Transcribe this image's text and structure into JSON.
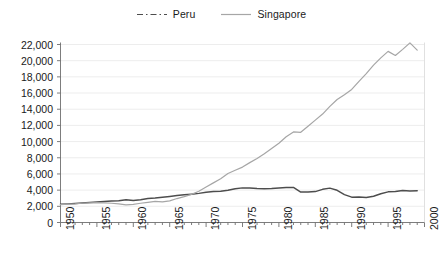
{
  "legend": {
    "position": "top-center",
    "entries": [
      {
        "label": "Peru",
        "color": "#4d4d4d",
        "style": "dash-dot",
        "icon": "legend-line-icon"
      },
      {
        "label": "Singapore",
        "color": "#a6a6a6",
        "style": "solid",
        "icon": "legend-line-icon"
      }
    ]
  },
  "chart_data": {
    "type": "line",
    "title": "",
    "subtitle": "",
    "xlabel": "",
    "ylabel": "",
    "xlim": [
      1950,
      2000
    ],
    "ylim": [
      0,
      22000
    ],
    "grid": true,
    "grid_axis": "y",
    "x_tick_step_major": 5,
    "x_tick_step_minor": 1,
    "y_tick_step": 2000,
    "xticks": [
      "1950",
      "1955",
      "1960",
      "1965",
      "1970",
      "1975",
      "1980",
      "1985",
      "1990",
      "1995",
      "2000"
    ],
    "yticks": [
      "0",
      "2,000",
      "4,000",
      "6,000",
      "8,000",
      "10,000",
      "12,000",
      "14,000",
      "16,000",
      "18,000",
      "20,000",
      "22,000"
    ],
    "x": [
      1950,
      1951,
      1952,
      1953,
      1954,
      1955,
      1956,
      1957,
      1958,
      1959,
      1960,
      1961,
      1962,
      1963,
      1964,
      1965,
      1966,
      1967,
      1968,
      1969,
      1970,
      1971,
      1972,
      1973,
      1974,
      1975,
      1976,
      1977,
      1978,
      1979,
      1980,
      1981,
      1982,
      1983,
      1984,
      1985,
      1986,
      1987,
      1988,
      1989,
      1990,
      1991,
      1992,
      1993,
      1994,
      1995,
      1996,
      1997,
      1998,
      1999
    ],
    "series": [
      {
        "name": "Peru",
        "color": "#4d4d4d",
        "style": "solid",
        "values": [
          2250,
          2300,
          2360,
          2420,
          2480,
          2540,
          2600,
          2660,
          2700,
          2800,
          2720,
          2820,
          2960,
          3020,
          3120,
          3220,
          3340,
          3420,
          3500,
          3600,
          3740,
          3820,
          3860,
          3980,
          4180,
          4280,
          4260,
          4200,
          4160,
          4200,
          4260,
          4320,
          4340,
          3760,
          3780,
          3820,
          4100,
          4250,
          3980,
          3450,
          3130,
          3150,
          3100,
          3250,
          3560,
          3790,
          3840,
          3950,
          3900,
          3920
        ]
      },
      {
        "name": "Singapore",
        "color": "#a6a6a6",
        "style": "solid",
        "values": [
          2200,
          2260,
          2300,
          2380,
          2420,
          2460,
          2420,
          2380,
          2300,
          2180,
          2250,
          2380,
          2480,
          2600,
          2560,
          2680,
          2960,
          3200,
          3480,
          3860,
          4400,
          4900,
          5400,
          6050,
          6450,
          6850,
          7400,
          7900,
          8500,
          9150,
          9800,
          10600,
          11200,
          11150,
          11900,
          12650,
          13400,
          14350,
          15200,
          15800,
          16450,
          17450,
          18400,
          19450,
          20350,
          21150,
          20650,
          21400,
          22200,
          21300
        ]
      }
    ]
  }
}
